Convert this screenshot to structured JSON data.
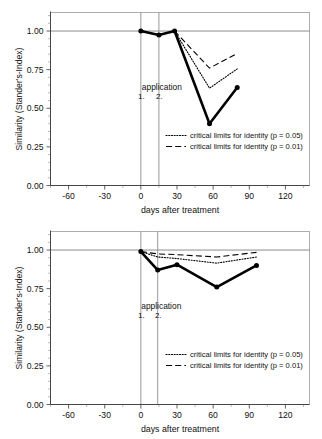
{
  "figure": {
    "name": "similarity-stander-index-two-panel-figure",
    "panel_count": 2
  },
  "axes": {
    "x_label": "days after treatment",
    "y_label": "Similarity (Stander's-Index)",
    "x_ticks": [
      "-60",
      "-30",
      "0",
      "30",
      "60",
      "90",
      "120"
    ],
    "y_ticks": [
      "0.00",
      "0.25",
      "0.50",
      "0.75",
      "1.00"
    ]
  },
  "annotations": {
    "application_label": "application",
    "application_1": "1.",
    "application_2": "2."
  },
  "legend": {
    "p05_label": "critical limits for identity (p = 0.05)",
    "p01_label": "critical limits for identity (p = 0.01)"
  },
  "colors": {
    "series_main": "#000000",
    "limits": "#000000",
    "frame": "#9a9a9a",
    "reference": "#6e6e6e",
    "background": "#ffffff"
  },
  "chart_data": [
    {
      "type": "line",
      "id": "panel-top",
      "title": "",
      "xlabel": "days after treatment",
      "ylabel": "Similarity (Stander's-Index)",
      "xlim": [
        -75,
        140
      ],
      "ylim": [
        0.0,
        1.12
      ],
      "xticks": [
        -60,
        -30,
        0,
        30,
        60,
        90,
        120
      ],
      "yticks": [
        0.0,
        0.25,
        0.5,
        0.75,
        1.0
      ],
      "grid": false,
      "reference_line_y": 1.0,
      "application_days": [
        0,
        15
      ],
      "legend_position": "inside-lower-right",
      "series": [
        {
          "name": "similarity",
          "style": "solid-thick-with-markers",
          "x": [
            0,
            15,
            28,
            57,
            80
          ],
          "values": [
            1.0,
            0.975,
            1.0,
            0.4,
            0.635
          ]
        },
        {
          "name": "critical limits for identity (p = 0.05)",
          "style": "dotted",
          "x": [
            28,
            57,
            80
          ],
          "values": [
            1.0,
            0.63,
            0.755
          ]
        },
        {
          "name": "critical limits for identity (p = 0.01)",
          "style": "dashed",
          "x": [
            28,
            57,
            80
          ],
          "values": [
            1.0,
            0.76,
            0.855
          ]
        }
      ]
    },
    {
      "type": "line",
      "id": "panel-bottom",
      "title": "",
      "xlabel": "days after treatment",
      "ylabel": "Similarity (Stander's-Index)",
      "xlim": [
        -75,
        140
      ],
      "ylim": [
        0.0,
        1.12
      ],
      "xticks": [
        -60,
        -30,
        0,
        30,
        60,
        90,
        120
      ],
      "yticks": [
        0.0,
        0.25,
        0.5,
        0.75,
        1.0
      ],
      "grid": false,
      "reference_line_y": 1.0,
      "application_days": [
        0,
        14
      ],
      "legend_position": "inside-lower-right",
      "series": [
        {
          "name": "similarity",
          "style": "solid-thick-with-markers",
          "x": [
            0,
            14,
            30,
            63,
            96
          ],
          "values": [
            0.99,
            0.87,
            0.905,
            0.76,
            0.9
          ]
        },
        {
          "name": "critical limits for identity (p = 0.05)",
          "style": "dotted",
          "x": [
            0,
            14,
            30,
            63,
            96
          ],
          "values": [
            0.99,
            0.955,
            0.945,
            0.915,
            0.955
          ]
        },
        {
          "name": "critical limits for identity (p = 0.01)",
          "style": "dashed",
          "x": [
            0,
            14,
            30,
            63,
            96
          ],
          "values": [
            0.99,
            0.975,
            0.97,
            0.955,
            0.985
          ]
        }
      ]
    }
  ]
}
